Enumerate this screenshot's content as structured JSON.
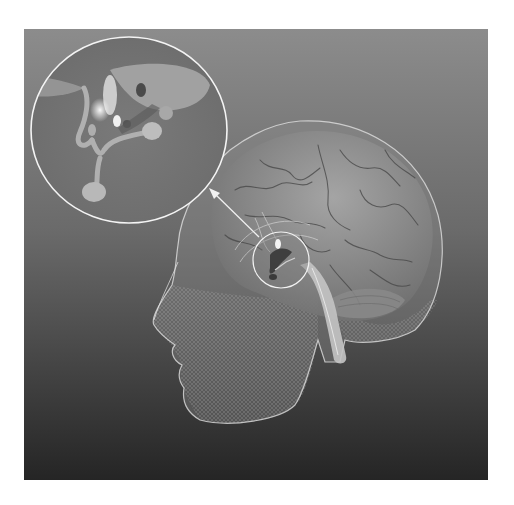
{
  "figure": {
    "subject": "3D rendered transparent human head with brain, pituitary region highlighted and magnified",
    "elements": {
      "head": "wireframe-head",
      "brain": "brain-with-gyri",
      "brainstem": "brainstem-and-spinal-cord",
      "highlight": "small-callout-circle",
      "magnified": "magnified-callout-circle",
      "pointer": "callout-arrow"
    }
  },
  "colors": {
    "background_top": "#8c8c8c",
    "background_bottom": "#262626",
    "outline": "#f2f2f2",
    "brain": "#9a9a9a",
    "brain_sulci": "#4a4a4a",
    "wireframe": "#cfcfcf",
    "page": "#ffffff"
  }
}
